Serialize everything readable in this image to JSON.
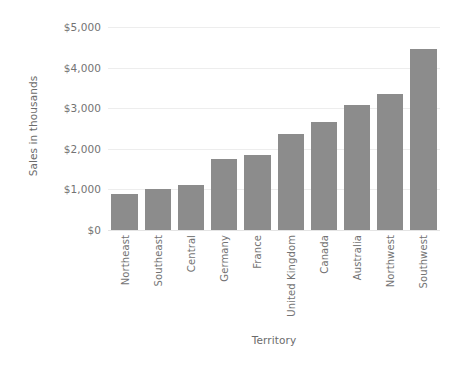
{
  "chart_data": {
    "type": "bar",
    "title": "",
    "xlabel": "Territory",
    "ylabel": "Sales in thousands",
    "categories": [
      "Northeast",
      "Southeast",
      "Central",
      "Germany",
      "France",
      "United Kingdom",
      "Canada",
      "Australia",
      "Northwest",
      "Southwest"
    ],
    "values": [
      890,
      1010,
      1110,
      1750,
      1850,
      2360,
      2660,
      3080,
      3350,
      4460
    ],
    "ylim": [
      0,
      5000
    ],
    "ytick_values": [
      0,
      1000,
      2000,
      3000,
      4000,
      5000
    ],
    "ytick_labels": [
      "$0",
      "$1,000",
      "$2,000",
      "$3,000",
      "$4,000",
      "$5,000"
    ],
    "grid": true,
    "legend": "none",
    "bar_color": "#8c8c8c",
    "gridline_color": "#ededed",
    "axis_text_color": "#737373"
  }
}
